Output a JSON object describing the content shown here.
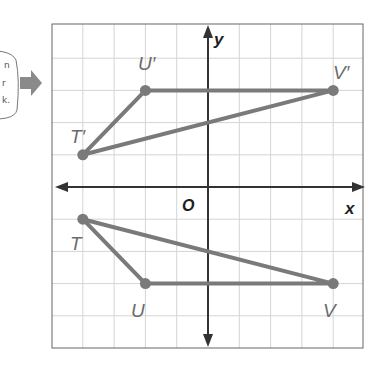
{
  "figure": {
    "type": "coordinate-plane-reflection",
    "axes": {
      "x_label": "x",
      "y_label": "y",
      "origin_label": "O"
    },
    "grid": {
      "x_range": [
        -5,
        5
      ],
      "y_range": [
        -5,
        5
      ],
      "step": 1
    },
    "colors": {
      "polygon": "#7a7a7a",
      "axis": "#333333",
      "grid": "#d4d4d4",
      "frame": "#666666",
      "arrow": "#8a8a8a"
    },
    "original": {
      "name": "TUV",
      "vertices": [
        {
          "label": "T",
          "x": -4,
          "y": -1
        },
        {
          "label": "U",
          "x": -2,
          "y": -3
        },
        {
          "label": "V",
          "x": 4,
          "y": -3
        }
      ]
    },
    "image": {
      "name": "T'U'V'",
      "vertices": [
        {
          "label": "T′",
          "x": -4,
          "y": 1
        },
        {
          "label": "U′",
          "x": -2,
          "y": 3
        },
        {
          "label": "V′",
          "x": 4,
          "y": 3
        }
      ]
    }
  },
  "side_note": {
    "lines": [
      "n",
      "r",
      "k."
    ],
    "pointer": "right-arrow"
  }
}
